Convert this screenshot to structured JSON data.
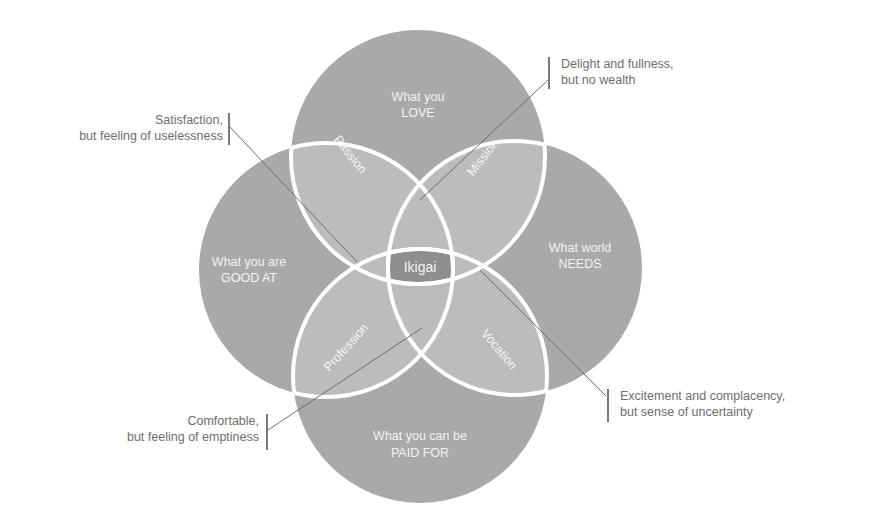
{
  "diagram": {
    "title": "Ikigai",
    "colors": {
      "outer_circle": "#a9a9a9",
      "overlap": "#bcbcbc",
      "center": "#8e8e8e",
      "outline": "#ffffff",
      "leader_line": "#6e6e6e",
      "annotation_text": "#6e6e6e"
    },
    "circles": [
      {
        "id": "love",
        "line1": "What you",
        "line2": "LOVE"
      },
      {
        "id": "good_at",
        "line1": "What you are",
        "line2": "GOOD AT"
      },
      {
        "id": "needs",
        "line1": "What world",
        "line2": "NEEDS"
      },
      {
        "id": "paid",
        "line1": "What you can be",
        "line2": "PAID FOR"
      }
    ],
    "overlaps": [
      {
        "id": "passion",
        "label": "Passion"
      },
      {
        "id": "mission",
        "label": "Mission"
      },
      {
        "id": "profession",
        "label": "Profession"
      },
      {
        "id": "vocation",
        "label": "Vocation"
      }
    ],
    "center": {
      "label": "Ikigai"
    },
    "annotations": [
      {
        "id": "passion_note",
        "line1": "Satisfaction,",
        "line2": "but feeling of uselessness"
      },
      {
        "id": "mission_note",
        "line1": "Delight and fullness,",
        "line2": "but no wealth"
      },
      {
        "id": "profession_note",
        "line1": "Comfortable,",
        "line2": "but feeling of emptiness"
      },
      {
        "id": "vocation_note",
        "line1": "Excitement and complacency,",
        "line2": "but sense of uncertainty"
      }
    ]
  }
}
